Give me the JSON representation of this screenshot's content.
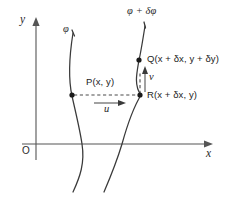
{
  "figure": {
    "background_color": "#ffffff",
    "curve_color": "#3a3a3a",
    "axis_color": "#555555",
    "text_color": "#1c1c1c",
    "width": 234,
    "height": 199
  },
  "axes": {
    "y_label": "y",
    "x_label": "x",
    "origin_label": "O"
  },
  "curves": [
    {
      "name": "streamline-phi",
      "label": "φ"
    },
    {
      "name": "streamline-phi-plus-delta-phi",
      "label": "φ + δφ"
    }
  ],
  "points": [
    {
      "id": "P",
      "label": "P(x, y)"
    },
    {
      "id": "Q",
      "label": "Q(x + δx, y + δy)"
    },
    {
      "id": "R",
      "label": "R(x + δx, y)"
    }
  ],
  "vectors": [
    {
      "id": "u",
      "label": "u",
      "direction": "horizontal-right"
    },
    {
      "id": "v",
      "label": "v",
      "direction": "vertical-up"
    }
  ]
}
